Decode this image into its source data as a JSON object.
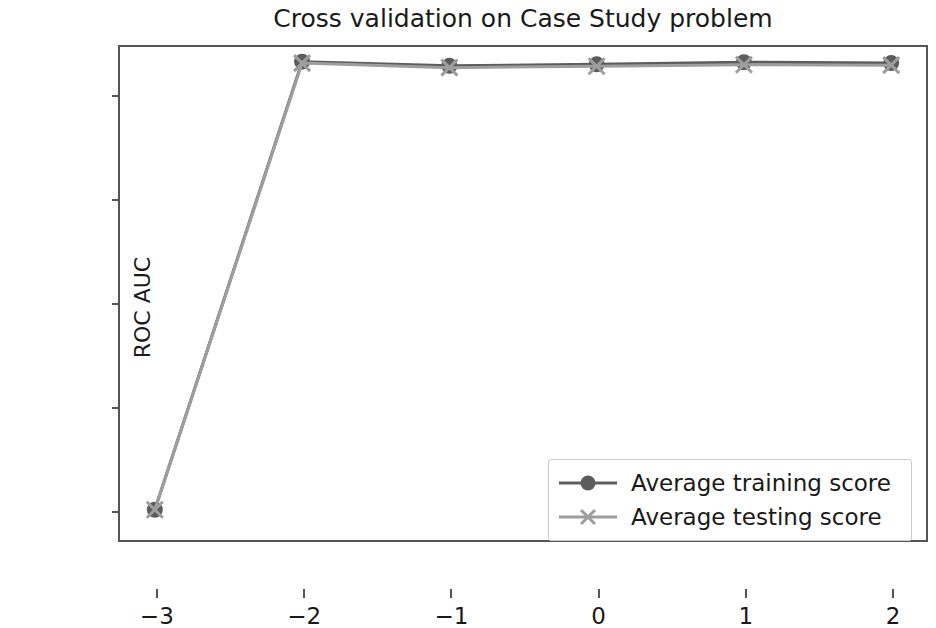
{
  "chart_data": {
    "type": "line",
    "title": "Cross validation on Case Study problem",
    "xlabel": "",
    "ylabel": "ROC AUC",
    "x": [
      -3,
      -2,
      -1,
      0,
      1,
      2
    ],
    "xticks": [
      "−3",
      "−2",
      "−1",
      "0",
      "1",
      "2"
    ],
    "yticks": [
      "0.50",
      "0.55",
      "0.60",
      "0.65",
      "0.70"
    ],
    "ytick_values": [
      0.5,
      0.55,
      0.6,
      0.65,
      0.7
    ],
    "xlim": [
      -3.25,
      2.25
    ],
    "ylim": [
      0.4845,
      0.7235
    ],
    "grid": false,
    "legend_position": "lower right",
    "series": [
      {
        "name": "Average training score",
        "values": [
          0.5,
          0.7155,
          0.7135,
          0.7142,
          0.7152,
          0.7148
        ],
        "color": "#5c5c5c",
        "marker": "circle"
      },
      {
        "name": "Average testing score",
        "values": [
          0.5,
          0.7148,
          0.7126,
          0.7133,
          0.714,
          0.7138
        ],
        "color": "#9e9e9e",
        "marker": "x"
      }
    ]
  },
  "legend": {
    "entries": [
      {
        "label": "Average training score"
      },
      {
        "label": "Average testing score"
      }
    ]
  },
  "colors": {
    "training": "#5c5c5c",
    "testing": "#9e9e9e",
    "axis": "#555555",
    "text": "#1a1a1a",
    "background": "#ffffff"
  }
}
